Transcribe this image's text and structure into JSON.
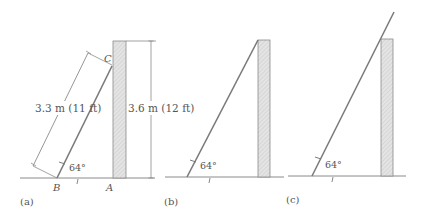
{
  "figure": {
    "panels": [
      {
        "id": "a",
        "caption": "(a)",
        "ladder_length_label": "3.3 m (11 ft)",
        "wall_height_label": "3.6 m (12 ft)",
        "angle_label": "64°",
        "point_labels": {
          "top": "C",
          "bottom": "B",
          "wall_base": "A"
        }
      },
      {
        "id": "b",
        "caption": "(b)",
        "angle_label": "64°"
      },
      {
        "id": "c",
        "caption": "(c)",
        "angle_label": "64°"
      }
    ],
    "colors": {
      "line": "#8a8a8a",
      "ladder": "#7a7a7a",
      "wall_fill": "#dcdcdc",
      "text": "#555555"
    }
  }
}
